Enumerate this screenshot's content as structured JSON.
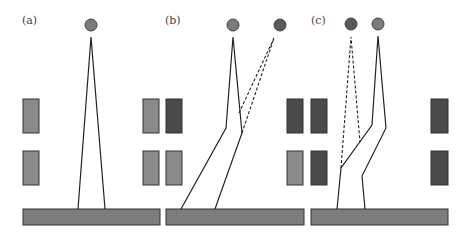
{
  "colors": {
    "block_dark": "#4a4a4a",
    "block_light": "#8a8a8a",
    "ground": "#7d7d7d",
    "source_light": "#7a7a7a",
    "source_dark": "#5a5a5a"
  },
  "panels": [
    {
      "id": "a",
      "label": "(a)",
      "label_pos": [
        22,
        24
      ],
      "ground": {
        "x": 23,
        "y": 209,
        "w": 137,
        "h": 16
      },
      "blocks": [
        {
          "x": 23,
          "y": 99,
          "w": 16,
          "h": 34,
          "shade": "block_light"
        },
        {
          "x": 23,
          "y": 151,
          "w": 16,
          "h": 34,
          "shade": "block_light"
        }
      ],
      "sources": [
        {
          "cx": 91,
          "cy": 25,
          "r": 6,
          "shade": "source_light"
        }
      ],
      "solid_paths": [
        [
          [
            78,
            209
          ],
          [
            91,
            37
          ],
          [
            105,
            209
          ]
        ]
      ],
      "dashed_paths": []
    },
    {
      "id": "b",
      "label": "(b)",
      "label_pos": [
        165,
        24
      ],
      "ground": {
        "x": 166,
        "y": 209,
        "w": 138,
        "h": 16
      },
      "blocks": [
        {
          "x": 143,
          "y": 99,
          "w": 16,
          "h": 34,
          "shade": "block_light"
        },
        {
          "x": 166,
          "y": 99,
          "w": 16,
          "h": 34,
          "shade": "block_dark"
        },
        {
          "x": 143,
          "y": 151,
          "w": 16,
          "h": 34,
          "shade": "block_light"
        },
        {
          "x": 166,
          "y": 151,
          "w": 16,
          "h": 34,
          "shade": "block_light"
        }
      ],
      "sources": [
        {
          "cx": 233,
          "cy": 25,
          "r": 6,
          "shade": "source_light"
        },
        {
          "cx": 280,
          "cy": 25,
          "r": 6,
          "shade": "source_dark"
        }
      ],
      "solid_paths": [
        [
          [
            181,
            209
          ],
          [
            226,
            128
          ],
          [
            233,
            37
          ],
          [
            242,
            133
          ],
          [
            215,
            209
          ]
        ]
      ],
      "dashed_paths": [
        [
          [
            239,
            113
          ],
          [
            274,
            38
          ],
          [
            242,
            133
          ]
        ]
      ]
    },
    {
      "id": "c",
      "label": "(c)",
      "label_pos": [
        311,
        24
      ],
      "ground": {
        "x": 311,
        "y": 209,
        "w": 137,
        "h": 16
      },
      "blocks": [
        {
          "x": 287,
          "y": 99,
          "w": 16,
          "h": 34,
          "shade": "block_dark"
        },
        {
          "x": 311,
          "y": 99,
          "w": 16,
          "h": 34,
          "shade": "block_dark"
        },
        {
          "x": 287,
          "y": 151,
          "w": 16,
          "h": 34,
          "shade": "block_light"
        },
        {
          "x": 311,
          "y": 151,
          "w": 16,
          "h": 34,
          "shade": "block_dark"
        },
        {
          "x": 431,
          "y": 99,
          "w": 17,
          "h": 34,
          "shade": "block_dark"
        },
        {
          "x": 431,
          "y": 151,
          "w": 17,
          "h": 34,
          "shade": "block_dark"
        }
      ],
      "sources": [
        {
          "cx": 351,
          "cy": 24,
          "r": 6,
          "shade": "source_dark"
        },
        {
          "cx": 378,
          "cy": 24,
          "r": 6,
          "shade": "source_light"
        }
      ],
      "solid_paths": [
        [
          [
            337,
            209
          ],
          [
            341,
            168
          ],
          [
            372,
            125
          ],
          [
            378,
            36
          ],
          [
            386,
            128
          ],
          [
            362,
            176
          ],
          [
            365,
            209
          ]
        ]
      ],
      "dashed_paths": [
        [
          [
            341,
            168
          ],
          [
            351,
            37
          ],
          [
            360,
            142
          ]
        ]
      ]
    }
  ],
  "extra_blocks": [
    {
      "x": 143,
      "y": 99,
      "w": 16,
      "h": 34,
      "shade": "block_light",
      "note": "right edge of panel a row (shared)"
    }
  ]
}
